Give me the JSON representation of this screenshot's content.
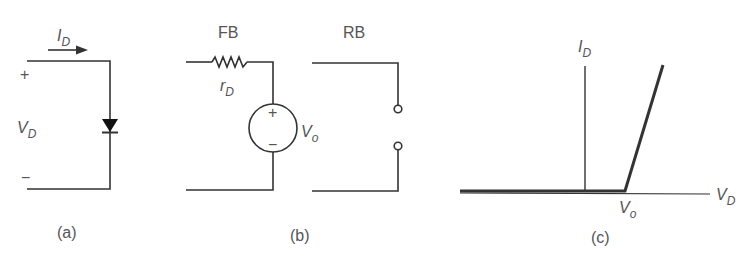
{
  "panel_a": {
    "caption": "(a)",
    "current_label": "I",
    "current_sub": "D",
    "voltage_label": "V",
    "voltage_sub": "D",
    "plus": "+",
    "minus": "−"
  },
  "panel_b": {
    "caption": "(b)",
    "fb_label": "FB",
    "rb_label": "RB",
    "resistor_label": "r",
    "resistor_sub": "D",
    "source_label": "V",
    "source_sub": "o",
    "source_plus": "+",
    "source_minus": "−"
  },
  "panel_c": {
    "caption": "(c)",
    "y_axis_label": "I",
    "y_axis_sub": "D",
    "x_axis_label": "V",
    "x_axis_sub": "D",
    "knee_label": "V",
    "knee_sub": "o"
  },
  "colors": {
    "line": "#333333",
    "text": "#555555"
  }
}
